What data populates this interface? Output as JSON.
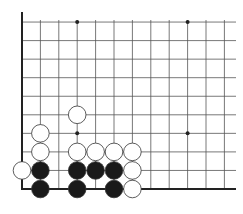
{
  "board": {
    "type": "go-board-fragment",
    "cols": 12,
    "rows": 10,
    "origin": "bottom-left",
    "left_edge": true,
    "bottom_edge": true,
    "colors": {
      "line": "#555555",
      "edge": "#222222",
      "black": "#1a1a1a",
      "white": "#ffffff",
      "star": "#222222"
    },
    "star_points": [
      [
        3,
        3
      ],
      [
        9,
        3
      ],
      [
        3,
        9
      ],
      [
        9,
        9
      ]
    ],
    "stones": [
      {
        "color": "white",
        "col": 3,
        "row": 4
      },
      {
        "color": "white",
        "col": 1,
        "row": 3
      },
      {
        "color": "white",
        "col": 1,
        "row": 2
      },
      {
        "color": "white",
        "col": 3,
        "row": 2
      },
      {
        "color": "white",
        "col": 4,
        "row": 2
      },
      {
        "color": "white",
        "col": 5,
        "row": 2
      },
      {
        "color": "white",
        "col": 6,
        "row": 2
      },
      {
        "color": "white",
        "col": 0,
        "row": 1
      },
      {
        "color": "white",
        "col": 6,
        "row": 1
      },
      {
        "color": "white",
        "col": 6,
        "row": 0
      },
      {
        "color": "black",
        "col": 1,
        "row": 1
      },
      {
        "color": "black",
        "col": 3,
        "row": 1
      },
      {
        "color": "black",
        "col": 4,
        "row": 1
      },
      {
        "color": "black",
        "col": 5,
        "row": 1
      },
      {
        "color": "black",
        "col": 1,
        "row": 0
      },
      {
        "color": "black",
        "col": 3,
        "row": 0
      },
      {
        "color": "black",
        "col": 5,
        "row": 0
      }
    ]
  }
}
